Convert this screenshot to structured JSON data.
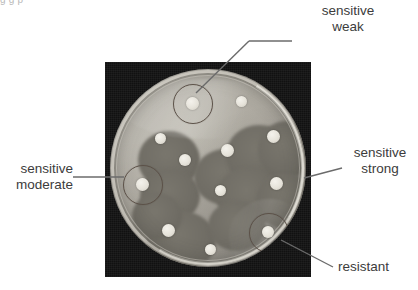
{
  "page": {
    "top_cropped_text": "g  g  p",
    "background_color": "#ffffff"
  },
  "figure": {
    "name": "antibiotic-disc-diffusion-petri-dish",
    "photo_background_color": "#121212",
    "agar_color": "#ada9a0",
    "inhibition_zone_color": "#706d65",
    "disc_color": "#e6e3da",
    "annotation_ring_color": "#5c5148",
    "leader_line_color": "#6b6b6b",
    "label_text_color": "#3c3c3c"
  },
  "annotations": [
    {
      "id": "sensitive-weak",
      "line1": "sensitive",
      "line2": "weak",
      "align": "center",
      "ring_center": [
        187,
        103
      ],
      "ring_radius": 19
    },
    {
      "id": "sensitive-moderate",
      "line1": "sensitive",
      "line2": "moderate",
      "align": "right",
      "ring_center": [
        142,
        184
      ],
      "ring_radius": 19
    },
    {
      "id": "sensitive-strong",
      "line1": "sensitive",
      "line2": "strong",
      "align": "left",
      "ring_center": null,
      "ring_radius": null
    },
    {
      "id": "resistant",
      "line1": "resistant",
      "line2": "",
      "align": "left",
      "ring_center": [
        268,
        232
      ],
      "ring_radius": 19
    }
  ],
  "discs": [
    {
      "id": "disc-top-left-ringed",
      "x": 187,
      "y": 103,
      "r": 6.5,
      "zone": "weak"
    },
    {
      "id": "disc-top-right",
      "x": 236,
      "y": 101,
      "r": 5.5,
      "zone": "none"
    },
    {
      "id": "disc-upper-left",
      "x": 155,
      "y": 138,
      "r": 5.5,
      "zone": "strong"
    },
    {
      "id": "disc-upper-right",
      "x": 273,
      "y": 136,
      "r": 6.5,
      "zone": "strong"
    },
    {
      "id": "disc-center-left",
      "x": 185,
      "y": 160,
      "r": 6.0,
      "zone": "strong"
    },
    {
      "id": "disc-center",
      "x": 227,
      "y": 150,
      "r": 6.5,
      "zone": "strong"
    },
    {
      "id": "disc-mid-left-ringed",
      "x": 142,
      "y": 184,
      "r": 6.5,
      "zone": "moderate"
    },
    {
      "id": "disc-mid-right",
      "x": 276,
      "y": 183,
      "r": 6.5,
      "zone": "strong"
    },
    {
      "id": "disc-center-low",
      "x": 220,
      "y": 190,
      "r": 5.5,
      "zone": "strong"
    },
    {
      "id": "disc-bottom-left",
      "x": 168,
      "y": 230,
      "r": 6.5,
      "zone": "strong"
    },
    {
      "id": "disc-bottom-center",
      "x": 210,
      "y": 249,
      "r": 5.5,
      "zone": "none"
    },
    {
      "id": "disc-bottom-right-ringed",
      "x": 268,
      "y": 232,
      "r": 6.0,
      "zone": "none"
    }
  ]
}
